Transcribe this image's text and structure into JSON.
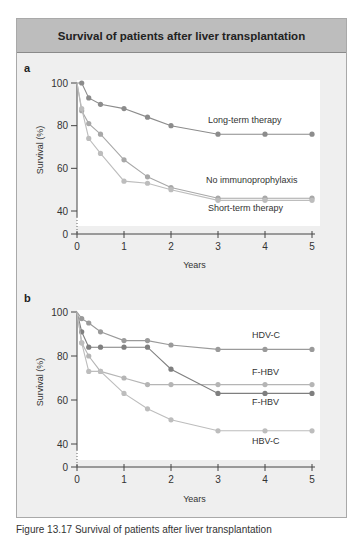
{
  "header": {
    "title": "Survival of patients after liver transplantation"
  },
  "caption": "Figure 13.17 Survival of patients after liver transplantation",
  "colors": {
    "header_bg": "#bdbdbd",
    "panel_bg": "#efefef",
    "plot_bg": "#ffffff",
    "dark_series": "#8c8c8c",
    "light_series": "#b5b5b5"
  },
  "chart_data": [
    {
      "panel": "a",
      "type": "line",
      "title": "",
      "xlabel": "Years",
      "ylabel": "Survival (%)",
      "x_ticks": [
        "0",
        "1",
        "2",
        "3",
        "4",
        "5"
      ],
      "y_ticks": [
        "0",
        "40",
        "60",
        "80",
        "100"
      ],
      "xlim": [
        0,
        5
      ],
      "ylim": [
        0,
        100
      ],
      "y_axis_break": "between 0 and 40",
      "grid": false,
      "x": [
        0,
        0.1,
        0.25,
        0.5,
        1,
        1.5,
        2,
        3,
        4,
        5
      ],
      "series": [
        {
          "name": "Long-term therapy",
          "color": "#8c8c8c",
          "values": [
            100,
            100,
            93,
            90,
            88,
            84,
            80,
            76,
            76,
            76
          ]
        },
        {
          "name": "No immunoprophylaxis",
          "color": "#a8a8a8",
          "values": [
            100,
            87,
            81,
            76,
            64,
            56,
            51,
            46,
            46,
            46
          ]
        },
        {
          "name": "Short-term therapy",
          "color": "#bdbdbd",
          "values": [
            100,
            88,
            74,
            67,
            54,
            53,
            50,
            45,
            45,
            45
          ]
        }
      ]
    },
    {
      "panel": "b",
      "type": "line",
      "title": "",
      "xlabel": "Years",
      "ylabel": "Survival (%)",
      "x_ticks": [
        "0",
        "1",
        "2",
        "3",
        "4",
        "5"
      ],
      "y_ticks": [
        "0",
        "40",
        "60",
        "80",
        "100"
      ],
      "xlim": [
        0,
        5
      ],
      "ylim": [
        0,
        100
      ],
      "y_axis_break": "between 0 and 40",
      "grid": false,
      "x": [
        0,
        0.1,
        0.25,
        0.5,
        1,
        1.5,
        2,
        3,
        4,
        5
      ],
      "series": [
        {
          "name": "HDV-C",
          "color": "#9a9a9a",
          "values": [
            100,
            97,
            95,
            91,
            87,
            87,
            85,
            83,
            83,
            83
          ]
        },
        {
          "name": "F-HBV",
          "color": "#b5b5b5",
          "values": [
            100,
            86,
            80,
            73,
            70,
            67,
            67,
            67,
            67,
            67
          ]
        },
        {
          "name": "F-HBV",
          "color": "#7f7f7f",
          "values": [
            100,
            91,
            84,
            84,
            84,
            84,
            74,
            63,
            63,
            63
          ]
        },
        {
          "name": "HBV-C",
          "color": "#bdbdbd",
          "values": [
            100,
            86,
            73,
            73,
            63,
            56,
            51,
            46,
            46,
            46
          ]
        }
      ]
    }
  ],
  "panels": [
    {
      "label": "a",
      "ylabel": "Survival (%)",
      "xlabel": "Years",
      "series_labels": [
        {
          "text": "Long-term therapy",
          "x": 208,
          "y": 123
        },
        {
          "text": "No immunoprophylaxis",
          "x": 206,
          "y": 183
        },
        {
          "text": "Short-term therapy",
          "x": 208,
          "y": 211
        }
      ]
    },
    {
      "label": "b",
      "ylabel": "Survival (%)",
      "xlabel": "Years",
      "series_labels": [
        {
          "text": "HDV-C",
          "x": 252,
          "y": 338
        },
        {
          "text": "F-HBV",
          "x": 252,
          "y": 375
        },
        {
          "text": "F-HBV",
          "x": 252,
          "y": 405
        },
        {
          "text": "HBV-C",
          "x": 252,
          "y": 444
        }
      ]
    }
  ]
}
